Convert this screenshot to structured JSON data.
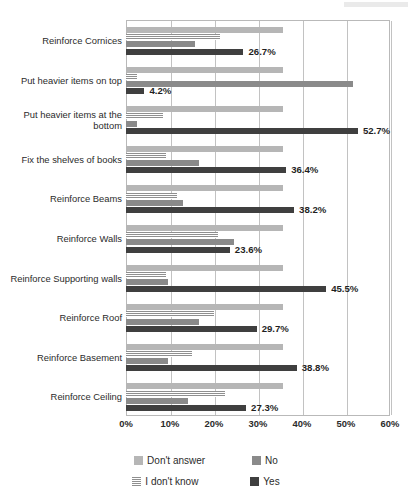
{
  "chart_data": {
    "type": "bar",
    "orientation": "horizontal",
    "title": "",
    "xlabel": "",
    "ylabel": "",
    "xlim": [
      0,
      60
    ],
    "xunit": "%",
    "grid": true,
    "legend_position": "bottom",
    "tick_labels": [
      "0%",
      "10%",
      "20%",
      "30%",
      "40%",
      "50%",
      "60%"
    ],
    "tick_values": [
      0,
      10,
      20,
      30,
      40,
      50,
      60
    ],
    "categories": [
      "Reinforce Cornices",
      "Put heavier items on top",
      "Put heavier items at the bottom",
      "Fix the shelves of books",
      "Reinforce Beams",
      "Reinforce Walls",
      "Reinforce Supporting walls",
      "Reinforce Roof",
      "Reinforce Basement",
      "Reinforce Ceiling"
    ],
    "series": [
      {
        "name": "Don't answer",
        "color": "#b6b6b6",
        "values": [
          35.7,
          35.7,
          35.7,
          35.7,
          35.7,
          35.7,
          35.7,
          35.7,
          35.7,
          35.7
        ]
      },
      {
        "name": "I don't know",
        "color": "#8f8f8f",
        "pattern": "horizontal-stripes",
        "values": [
          21.4,
          2.5,
          8.5,
          9.0,
          11.5,
          21.0,
          9.0,
          20.0,
          15.0,
          22.5
        ]
      },
      {
        "name": "No",
        "color": "#8a8a8a",
        "values": [
          15.7,
          51.5,
          2.5,
          16.5,
          13.0,
          24.5,
          9.5,
          16.5,
          9.5,
          14.0
        ]
      },
      {
        "name": "Yes",
        "color": "#3f3f3f",
        "values": [
          26.7,
          4.2,
          52.7,
          36.4,
          38.2,
          23.6,
          45.5,
          29.7,
          38.8,
          27.3
        ],
        "labels": [
          "26.7%",
          "4.2%",
          "52.7%",
          "36.4%",
          "38.2%",
          "23.6%",
          "45.5%",
          "29.7%",
          "38.8%",
          "27.3%"
        ]
      }
    ]
  },
  "legend": {
    "items": [
      {
        "label": "Don't answer",
        "key": "dontanswer"
      },
      {
        "label": "No",
        "key": "no"
      },
      {
        "label": "I don't know",
        "key": "idontknow"
      },
      {
        "label": "Yes",
        "key": "yes"
      }
    ]
  }
}
